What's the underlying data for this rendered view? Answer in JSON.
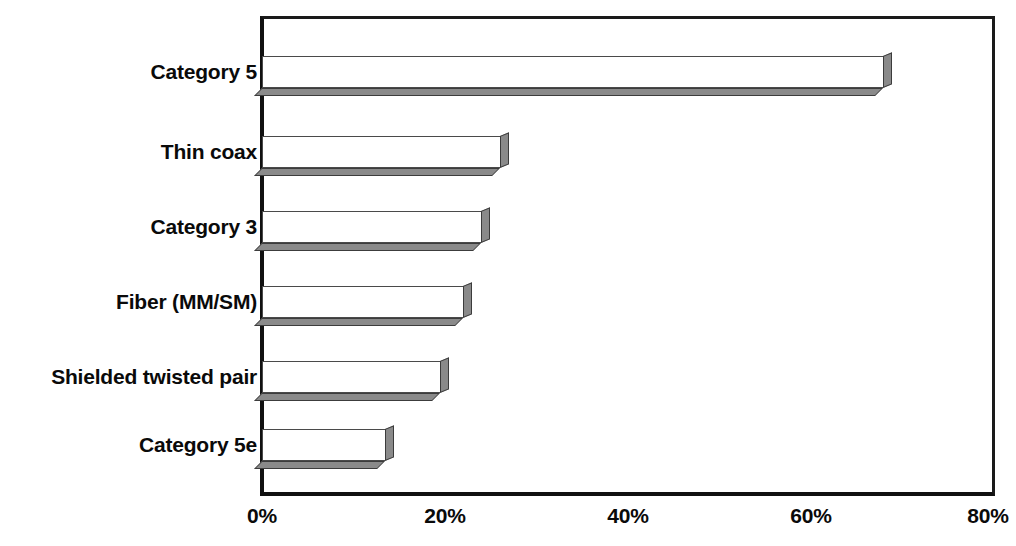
{
  "chart_data": {
    "type": "bar",
    "orientation": "horizontal",
    "title": "",
    "xlabel": "",
    "ylabel": "",
    "categories": [
      "Category 5",
      "Thin coax",
      "Category 3",
      "Fiber (MM/SM)",
      "Shielded twisted pair",
      "Category 5e"
    ],
    "values": [
      68,
      26,
      24,
      22,
      19.5,
      13.5
    ],
    "value_suffix": "%",
    "xlim": [
      0,
      80
    ],
    "xticks": [
      0,
      20,
      40,
      60,
      80
    ],
    "xtick_labels": [
      "0%",
      "20%",
      "40%",
      "60%",
      "80%"
    ],
    "grid": false,
    "legend": false,
    "style": {
      "bar_face_color": "#ffffff",
      "bar_edge_color": "#4a4a4a",
      "bar_3d_shadow_color": "#8a8a8a",
      "axis_color": "#111111",
      "text_color": "#0a0a0a",
      "background_color": "#ffffff",
      "effect": "3d-perspective"
    }
  }
}
